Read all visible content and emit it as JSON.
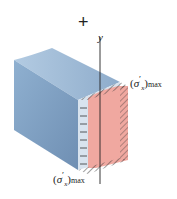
{
  "diagram": {
    "sign": "+",
    "axis_label": "y",
    "labels": {
      "top": {
        "open": "(",
        "sigma": "σ",
        "prime": "′",
        "sub": "x",
        "close": ")",
        "max": "max"
      },
      "bottom": {
        "open": "(",
        "sigma": "σ",
        "prime": "′",
        "sub": "x",
        "close": ")",
        "max": "max"
      }
    },
    "colors": {
      "beam": "#7f9fc2",
      "beam_top": "#a9c2dc",
      "stress_face": "#f0a8a0",
      "hatch": "#333333"
    }
  }
}
